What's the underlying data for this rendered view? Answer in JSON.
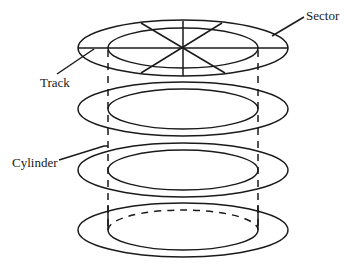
{
  "diagram": {
    "labels": {
      "sector": "Sector",
      "track": "Track",
      "cylinder": "Cylinder"
    },
    "colors": {
      "stroke": "#1a1a1a",
      "background": "#ffffff"
    },
    "platters": [
      {
        "name": "platter-1",
        "center_y": 48,
        "sector_lines": 8
      },
      {
        "name": "platter-2",
        "center_y": 109
      },
      {
        "name": "platter-3",
        "center_y": 170
      },
      {
        "name": "platter-4",
        "center_y": 230,
        "inner_top_dashed": true
      }
    ]
  }
}
